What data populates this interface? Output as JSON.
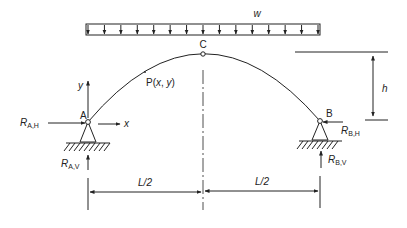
{
  "diagram": {
    "type": "three-hinged parabolic arch under uniformly distributed load",
    "load": {
      "label": "w",
      "arrow_count": 15
    },
    "crown": {
      "label": "C"
    },
    "point": {
      "label_prefix": "P(",
      "x": "x",
      "sep": ", ",
      "y": "y",
      "suffix": ")"
    },
    "supports": {
      "A": {
        "label": "A",
        "h_reaction": {
          "main": "R",
          "sub": "A,H"
        },
        "v_reaction": {
          "main": "R",
          "sub": "A,V"
        }
      },
      "B": {
        "label": "B",
        "h_reaction": {
          "main": "R",
          "sub": "B,H"
        },
        "v_reaction": {
          "main": "R",
          "sub": "B,V"
        }
      }
    },
    "axes": {
      "x": "x",
      "y": "y"
    },
    "dimensions": {
      "rise": "h",
      "left_span": "L/2",
      "right_span": "L/2"
    },
    "colors": {
      "ink": "#222222",
      "background": "#ffffff"
    }
  }
}
